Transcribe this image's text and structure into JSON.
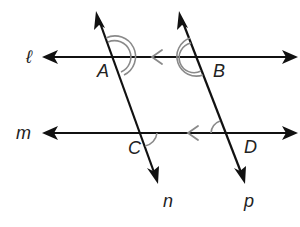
{
  "diagram": {
    "title": "",
    "lines": [
      {
        "id": "l",
        "label": "ℓ",
        "type": "horizontal",
        "parallel_to": "m"
      },
      {
        "id": "m",
        "label": "m",
        "type": "horizontal",
        "parallel_to": "l"
      },
      {
        "id": "n",
        "label": "n",
        "type": "transversal",
        "parallel_to": "p"
      },
      {
        "id": "p",
        "label": "p",
        "type": "transversal",
        "parallel_to": "n"
      }
    ],
    "points": [
      {
        "id": "A",
        "label": "A",
        "on": [
          "l",
          "n"
        ]
      },
      {
        "id": "B",
        "label": "B",
        "on": [
          "l",
          "p"
        ]
      },
      {
        "id": "C",
        "label": "C",
        "on": [
          "m",
          "n"
        ]
      },
      {
        "id": "D",
        "label": "D",
        "on": [
          "m",
          "p"
        ]
      }
    ],
    "angle_marks": [
      {
        "vertex": "A",
        "arcs": 2
      },
      {
        "vertex": "B",
        "arcs": 2
      },
      {
        "vertex": "C",
        "arcs": 1
      },
      {
        "vertex": "D",
        "arcs": 1
      }
    ],
    "parallel_markers": [
      {
        "on": "l",
        "glyph": "<"
      },
      {
        "on": "m",
        "glyph": "<"
      }
    ],
    "colors": {
      "line": "#111111",
      "mark": "#8a8a8a",
      "background": "#ffffff"
    }
  }
}
